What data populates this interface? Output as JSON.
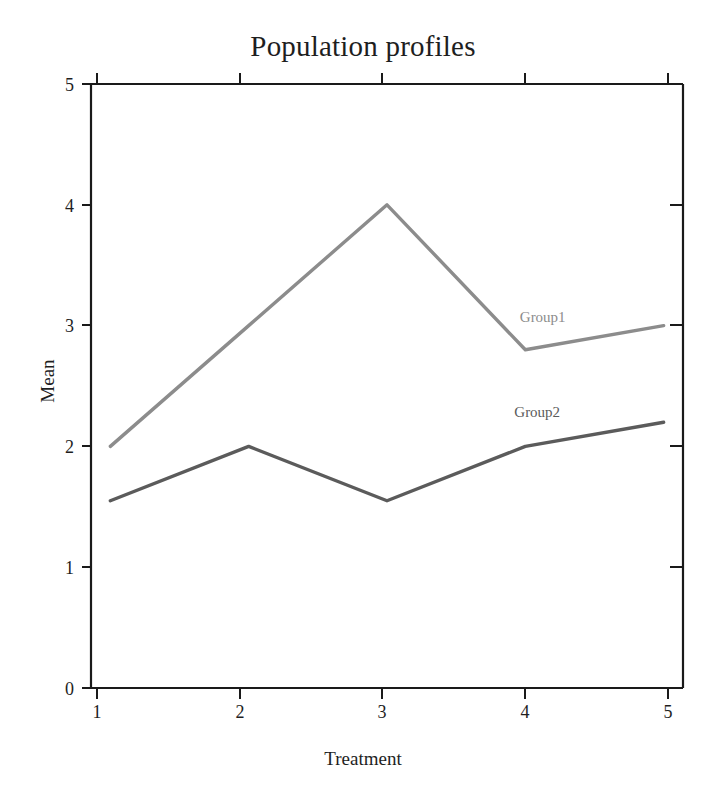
{
  "chart_data": {
    "type": "line",
    "title": "Population profiles",
    "xlabel": "Treatment",
    "ylabel": "Mean",
    "x": [
      1,
      2,
      3,
      4,
      5
    ],
    "xticklabels": [
      "1",
      "2",
      "3",
      "4",
      "5"
    ],
    "yticklabels": [
      "0",
      "1",
      "2",
      "3",
      "4",
      "5"
    ],
    "xlim": [
      0.86,
      5.14
    ],
    "ylim": [
      0,
      5
    ],
    "grid": false,
    "legend_position": "inline-right",
    "series": [
      {
        "name": "Group1",
        "color": "#8c8c8c",
        "values": [
          2.0,
          3.0,
          4.0,
          2.8,
          3.0
        ],
        "label": "Group1",
        "label_x": 3.96,
        "label_y": 3.06
      },
      {
        "name": "Group2",
        "color": "#5b5b5b",
        "values": [
          1.55,
          2.0,
          1.55,
          2.0,
          2.2
        ],
        "label": "Group2",
        "label_x": 3.92,
        "label_y": 2.28
      }
    ],
    "axis_color": "#1a1a1a",
    "background": "#ffffff"
  }
}
